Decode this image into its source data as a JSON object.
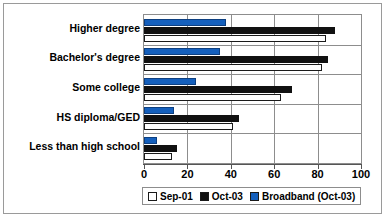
{
  "chart_data": {
    "type": "bar",
    "orientation": "horizontal",
    "title": "",
    "xlabel": "",
    "ylabel": "",
    "xlim": [
      0,
      100
    ],
    "xticks": [
      0,
      20,
      40,
      60,
      80,
      100
    ],
    "grid": true,
    "legend_position": "bottom",
    "categories": [
      "Higher degree",
      "Bachelor's degree",
      "Some college",
      "HS diploma/GED",
      "Less than high school"
    ],
    "series": [
      {
        "name": "Sep-01",
        "color": "#ffffff",
        "values": [
          84,
          82,
          63,
          41,
          13
        ]
      },
      {
        "name": "Oct-03",
        "color": "#111111",
        "values": [
          88,
          85,
          68,
          44,
          15
        ]
      },
      {
        "name": "Broadband (Oct-03)",
        "color": "#1560bd",
        "values": [
          38,
          35,
          24,
          14,
          6
        ]
      }
    ]
  },
  "legend": {
    "entries": [
      {
        "label": "Sep-01",
        "swatch": "#ffffff"
      },
      {
        "label": "Oct-03",
        "swatch": "#111111"
      },
      {
        "label": "Broadband (Oct-03)",
        "swatch": "#1560bd"
      }
    ]
  },
  "axis": {
    "tick_labels": [
      "0",
      "20",
      "40",
      "60",
      "80",
      "100"
    ]
  }
}
